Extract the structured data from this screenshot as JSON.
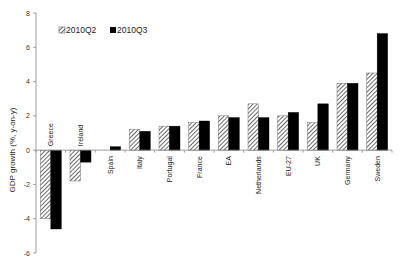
{
  "chart_data": {
    "type": "bar",
    "title": "",
    "xlabel": "",
    "ylabel": "GDP growth (%, y-on-y)",
    "ylim": [
      -6,
      8
    ],
    "yticks": [
      -6,
      -4,
      -2,
      0,
      2,
      4,
      6,
      8
    ],
    "grid": false,
    "legend_position": "top-left",
    "categories": [
      "Greece",
      "Ireland",
      "Spain",
      "Italy",
      "Portugal",
      "France",
      "EA",
      "Netherlands",
      "EU-27",
      "UK",
      "Germany",
      "Sweden"
    ],
    "series": [
      {
        "name": "2010Q2",
        "pattern": "hatched",
        "values": [
          -4.0,
          -1.8,
          0.0,
          1.2,
          1.4,
          1.6,
          2.0,
          2.7,
          2.0,
          1.6,
          3.9,
          4.5
        ]
      },
      {
        "name": "2010Q3",
        "pattern": "solid",
        "values": [
          -4.6,
          -0.7,
          0.2,
          1.1,
          1.4,
          1.7,
          1.9,
          1.9,
          2.2,
          2.7,
          3.9,
          6.8
        ]
      }
    ],
    "label_positions": [
      "above",
      "above",
      "below",
      "below",
      "below",
      "below",
      "below",
      "below",
      "below",
      "below",
      "below",
      "below"
    ]
  },
  "colors": {
    "q2_hatch_fg": "#444444",
    "q2_hatch_bg": "#ffffff",
    "q3_fill": "#000000",
    "axis": "#888888"
  }
}
